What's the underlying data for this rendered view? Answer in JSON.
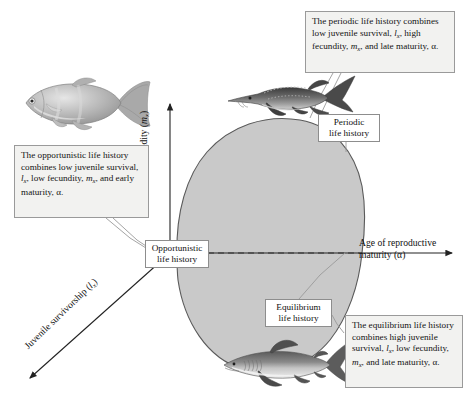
{
  "figure": {
    "kind": "conceptual-triangular-model",
    "shape_fill": "#c9c9c9",
    "shape_stroke": "#555555",
    "background": "#ffffff"
  },
  "axes": {
    "x": {
      "label_plain": "Age of reproductive maturity (α)",
      "label_line1": "Age of reproductive",
      "label_line2_pre": "maturity (",
      "label_line2_symbol": "α",
      "label_line2_post": ")",
      "direction": "right",
      "has_arrow": true
    },
    "y": {
      "label_plain": "Fecundity (mx)",
      "label_pre": "Fecundity (",
      "label_italic": "m",
      "label_sub": "x",
      "label_post": ")",
      "direction": "up",
      "has_arrow": true
    },
    "diagonal": {
      "label_plain": "Juvenile survivorship (lx)",
      "label_pre": "Juvenile survivorship (",
      "label_italic": "l",
      "label_sub": "x",
      "label_post": ")",
      "direction": "down-left",
      "has_arrow": true
    }
  },
  "tags": {
    "periodic": {
      "line1": "Periodic",
      "line2": "life history"
    },
    "opportunistic": {
      "line1": "Opportunistic",
      "line2": "life history"
    },
    "equilibrium": {
      "line1": "Equilibrium",
      "line2": "life history"
    }
  },
  "callouts": {
    "periodic": {
      "full_text": "The periodic life history combines low juvenile survival, lx, high fecundity, mx, and late maturity, α.",
      "seg1": "The periodic life history combines low juvenile survival, ",
      "sym1_italic": "l",
      "sym1_sub": "x",
      "seg2": ", high fecundity, ",
      "sym2_italic": "m",
      "sym2_sub": "x",
      "seg3": ", and late maturity, ",
      "sym3": "α",
      "seg4": "."
    },
    "opportunistic": {
      "full_text": "The opportunistic life history combines low juvenile survival, lx, low fecundity, mx, and early maturity, α.",
      "seg1": "The opportunistic life history combines low juvenile survival, ",
      "sym1_italic": "l",
      "sym1_sub": "x",
      "seg2": ", low fecundity, ",
      "sym2_italic": "m",
      "sym2_sub": "x",
      "seg3": ", and early maturity, ",
      "sym3": "α",
      "seg4": "."
    },
    "equilibrium": {
      "full_text": "The equilibrium life history combines high juvenile survival, lx, low fecundity, mx, and late maturity, α.",
      "seg1": "The equilibrium life history combines high juvenile survival, ",
      "sym1_italic": "l",
      "sym1_sub": "x",
      "seg2": ", low fecundity, ",
      "sym2_italic": "m",
      "sym2_sub": "x",
      "seg3": ", and late maturity, ",
      "sym3": "α",
      "seg4": "."
    }
  },
  "organisms": {
    "opportunistic": "guppy-fish-photo",
    "periodic": "sturgeon-fish-photo",
    "equilibrium": "shark-fish-photo"
  }
}
